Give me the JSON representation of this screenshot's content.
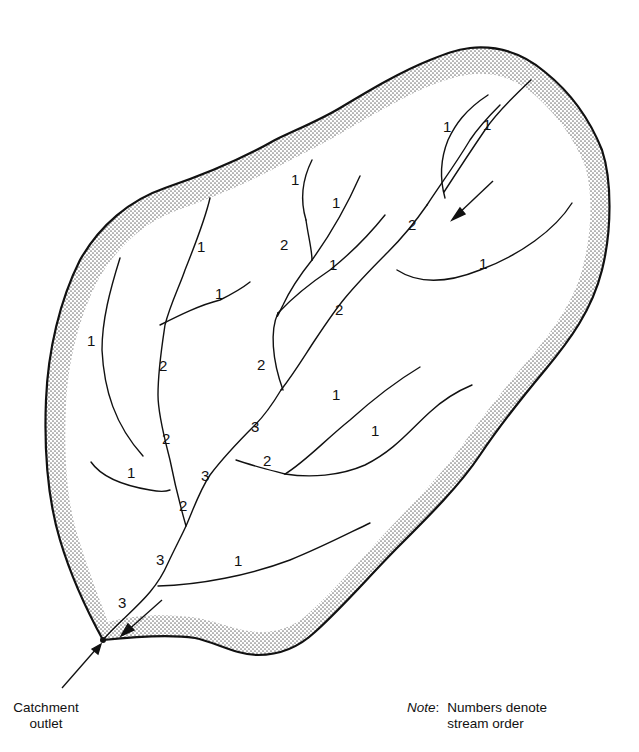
{
  "figure": {
    "type": "catchment stream-order diagram",
    "colors": {
      "boundary": "#111111",
      "stream": "#111111",
      "stipple": "#9a9a9a",
      "background": "#ffffff"
    }
  },
  "captions": {
    "outlet_line1": "Catchment",
    "outlet_line2": "outlet",
    "note_key": "Note",
    "note_colon": ":",
    "note_line1": "Numbers denote",
    "note_line2": "stream order"
  },
  "stream_order_labels": [
    {
      "value": "1",
      "x": 487,
      "y": 130
    },
    {
      "value": "1",
      "x": 447,
      "y": 128
    },
    {
      "value": "1",
      "x": 295,
      "y": 181
    },
    {
      "value": "1",
      "x": 336,
      "y": 204
    },
    {
      "value": "2",
      "x": 412,
      "y": 226
    },
    {
      "value": "1",
      "x": 201,
      "y": 248
    },
    {
      "value": "2",
      "x": 284,
      "y": 246
    },
    {
      "value": "1",
      "x": 333,
      "y": 266
    },
    {
      "value": "1",
      "x": 483,
      "y": 265
    },
    {
      "value": "1",
      "x": 219,
      "y": 295
    },
    {
      "value": "2",
      "x": 339,
      "y": 311
    },
    {
      "value": "1",
      "x": 91,
      "y": 342
    },
    {
      "value": "2",
      "x": 163,
      "y": 367
    },
    {
      "value": "2",
      "x": 261,
      "y": 366
    },
    {
      "value": "1",
      "x": 336,
      "y": 396
    },
    {
      "value": "3",
      "x": 255,
      "y": 428
    },
    {
      "value": "1",
      "x": 375,
      "y": 432
    },
    {
      "value": "2",
      "x": 166,
      "y": 440
    },
    {
      "value": "2",
      "x": 267,
      "y": 462
    },
    {
      "value": "1",
      "x": 131,
      "y": 474
    },
    {
      "value": "3",
      "x": 205,
      "y": 477
    },
    {
      "value": "2",
      "x": 183,
      "y": 507
    },
    {
      "value": "3",
      "x": 160,
      "y": 561
    },
    {
      "value": "1",
      "x": 238,
      "y": 562
    },
    {
      "value": "3",
      "x": 122,
      "y": 604
    }
  ],
  "arrows": [
    {
      "name": "flow-arrow-upper",
      "direction": "south-west"
    },
    {
      "name": "flow-arrow-outlet",
      "direction": "south-west"
    },
    {
      "name": "outlet-pointer-arrow",
      "direction": "north-east"
    }
  ]
}
